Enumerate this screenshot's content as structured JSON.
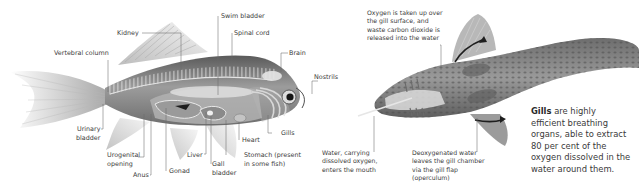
{
  "left_diagram": {
    "subject": "fish internal anatomy (side view)",
    "labels": {
      "kidney": "Kidney",
      "swim_bladder": "Swim bladder",
      "spinal_cord": "Spinal cord",
      "vertebral_column": "Vertebral column",
      "brain": "Brain",
      "nostrils": "Nostrils",
      "urinary_bladder_1": "Urinary",
      "urinary_bladder_2": "bladder",
      "urogenital_1": "Urogenital",
      "urogenital_2": "opening",
      "anus": "Anus",
      "gonad": "Gonad",
      "liver": "Liver",
      "gall_bladder_1": "Gall",
      "gall_bladder_2": "bladder",
      "heart": "Heart",
      "gills": "Gills",
      "stomach_1": "Stomach (present",
      "stomach_2": "in some fish)"
    }
  },
  "right_diagram": {
    "subject": "fish gill water flow (top view)",
    "notes": {
      "oxygen": [
        "Oxygen is taken up over",
        "the gill surface, and",
        "waste carbon dioxide is",
        "released into the water"
      ],
      "water_in": [
        "Water, carrying",
        "dissolved oxygen,",
        "enters the mouth"
      ],
      "water_out": [
        "Deoxygenated water",
        "leaves the gill chamber",
        "via the gill flap",
        "(operculum)"
      ]
    },
    "callout": {
      "bold": "Gills",
      "line1_rest": " are highly",
      "line2": "efficient breathing",
      "line3": "organs, able to extract",
      "line4": "80 per cent of the",
      "line5": "oxygen dissolved in the",
      "line6": "water around them."
    }
  },
  "colors": {
    "leader_line": "#6a6a6a",
    "fish_body": "#8a8a8a",
    "fish_dark": "#4a4a4a",
    "arrow": "#222222"
  }
}
